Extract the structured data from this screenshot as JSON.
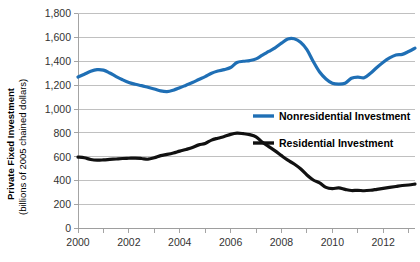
{
  "chart_data": {
    "type": "line",
    "title": "",
    "xlabel": "",
    "ylabel": "Private Fixed Investment",
    "ylabel_sub": "(billions of 2005 chained dollars)",
    "ylim": [
      0,
      1800
    ],
    "xlim": [
      2000,
      2013.25
    ],
    "grid": true,
    "legend_position": "inside-right",
    "y_ticks": [
      0,
      200,
      400,
      600,
      800,
      1000,
      1200,
      1400,
      1600,
      1800
    ],
    "y_tick_labels": [
      "0",
      "200",
      "400",
      "600",
      "800",
      "1,000",
      "1,200",
      "1,400",
      "1,600",
      "1,800"
    ],
    "x_ticks": [
      2000,
      2002,
      2004,
      2006,
      2008,
      2010,
      2012
    ],
    "x_tick_labels": [
      "2000",
      "2002",
      "2004",
      "2006",
      "2008",
      "2010",
      "2012"
    ],
    "x_minor_ticks": [
      2001,
      2003,
      2005,
      2007,
      2009,
      2011,
      2013
    ],
    "series": [
      {
        "name": "Nonresidential Investment",
        "color": "#1F6FB5",
        "width": 3.2,
        "x": [
          2000.0,
          2000.25,
          2000.5,
          2000.75,
          2001.0,
          2001.25,
          2001.5,
          2001.75,
          2002.0,
          2002.25,
          2002.5,
          2002.75,
          2003.0,
          2003.25,
          2003.5,
          2003.75,
          2004.0,
          2004.25,
          2004.5,
          2004.75,
          2005.0,
          2005.25,
          2005.5,
          2005.75,
          2006.0,
          2006.25,
          2006.5,
          2006.75,
          2007.0,
          2007.25,
          2007.5,
          2007.75,
          2008.0,
          2008.25,
          2008.5,
          2008.75,
          2009.0,
          2009.25,
          2009.5,
          2009.75,
          2010.0,
          2010.25,
          2010.5,
          2010.75,
          2011.0,
          2011.25,
          2011.5,
          2011.75,
          2012.0,
          2012.25,
          2012.5,
          2012.75,
          2013.0,
          2013.25
        ],
        "values": [
          1268,
          1292,
          1316,
          1330,
          1326,
          1302,
          1272,
          1245,
          1222,
          1208,
          1196,
          1182,
          1168,
          1152,
          1146,
          1158,
          1178,
          1200,
          1222,
          1248,
          1272,
          1300,
          1318,
          1330,
          1348,
          1390,
          1400,
          1406,
          1420,
          1452,
          1482,
          1512,
          1552,
          1586,
          1588,
          1560,
          1498,
          1398,
          1310,
          1252,
          1216,
          1208,
          1216,
          1258,
          1268,
          1262,
          1300,
          1348,
          1392,
          1428,
          1452,
          1458,
          1482,
          1510
        ]
      },
      {
        "name": "Residential Investment",
        "color": "#111111",
        "width": 3.2,
        "x": [
          2000.0,
          2000.25,
          2000.5,
          2000.75,
          2001.0,
          2001.25,
          2001.5,
          2001.75,
          2002.0,
          2002.25,
          2002.5,
          2002.75,
          2003.0,
          2003.25,
          2003.5,
          2003.75,
          2004.0,
          2004.25,
          2004.5,
          2004.75,
          2005.0,
          2005.25,
          2005.5,
          2005.75,
          2006.0,
          2006.25,
          2006.5,
          2006.75,
          2007.0,
          2007.25,
          2007.5,
          2007.75,
          2008.0,
          2008.25,
          2008.5,
          2008.75,
          2009.0,
          2009.25,
          2009.5,
          2009.75,
          2010.0,
          2010.25,
          2010.5,
          2010.75,
          2011.0,
          2011.25,
          2011.5,
          2011.75,
          2012.0,
          2012.25,
          2012.5,
          2012.75,
          2013.0,
          2013.25
        ],
        "values": [
          598,
          592,
          578,
          572,
          574,
          578,
          582,
          586,
          588,
          590,
          586,
          580,
          592,
          610,
          620,
          632,
          648,
          662,
          678,
          700,
          712,
          740,
          756,
          770,
          788,
          798,
          794,
          786,
          768,
          722,
          686,
          650,
          610,
          572,
          540,
          500,
          448,
          406,
          382,
          344,
          334,
          340,
          328,
          318,
          320,
          316,
          320,
          328,
          336,
          344,
          352,
          360,
          364,
          372
        ]
      }
    ]
  },
  "legend": {
    "items": [
      {
        "label": "Nonresidential Investment",
        "color": "#1F6FB5"
      },
      {
        "label": "Residential Investment",
        "color": "#111111"
      }
    ]
  },
  "axis": {
    "y_title_line1": "Private Fixed Investment",
    "y_title_line2": "(billions of 2005 chained dollars)"
  }
}
